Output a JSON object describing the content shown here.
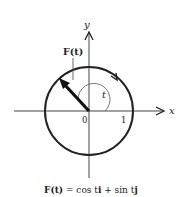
{
  "diagram": {
    "type": "unit-circle-vector-function",
    "axes": {
      "x_label": "x",
      "y_label": "y",
      "origin_label": "0",
      "unit_tick_label": "1"
    },
    "vector_label": "F(t)",
    "angle_label": "t",
    "caption": "F(t) = cos ti + sin tj",
    "caption_parts": {
      "lhs": "F(t)",
      "eq": " = cos t",
      "i": "i",
      "plus": " + sin t",
      "j": "j"
    },
    "colors": {
      "stroke": "#222222",
      "background": "#ffffff"
    }
  }
}
